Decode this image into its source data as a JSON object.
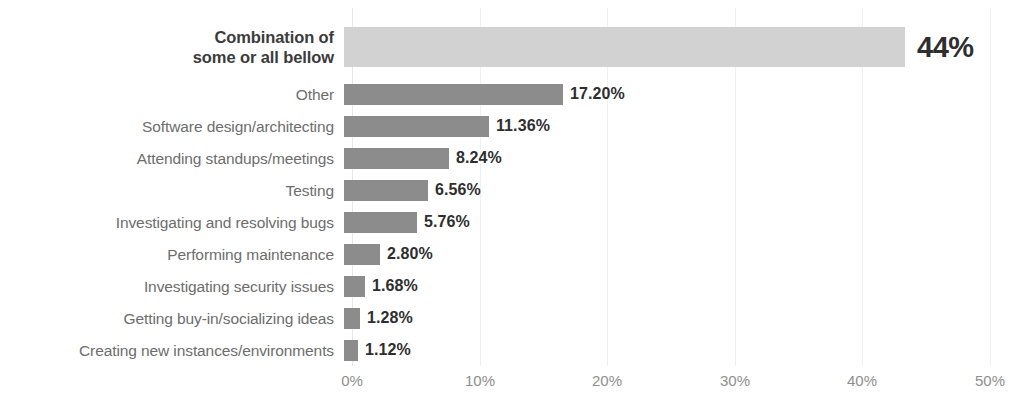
{
  "chart_data": {
    "type": "bar",
    "orientation": "horizontal",
    "title": "",
    "subtitle": "",
    "xlabel": "",
    "ylabel": "",
    "xlim": [
      0,
      50
    ],
    "grid": true,
    "legend": null,
    "tick_labels": [
      "0%",
      "10%",
      "20%",
      "30%",
      "40%",
      "50%"
    ],
    "tick_values": [
      0,
      10,
      20,
      30,
      40,
      50
    ],
    "categories": [
      "Combination of\nsome or all bellow",
      "Other",
      "Software design/architecting",
      "Attending standups/meetings",
      "Testing",
      "Investigating and resolving bugs",
      "Performing maintenance",
      "Investigating security issues",
      "Getting buy-in/socializing ideas",
      "Creating new instances/environments"
    ],
    "values": [
      44,
      17.2,
      11.36,
      8.24,
      6.56,
      5.76,
      2.8,
      1.68,
      1.28,
      1.12
    ],
    "value_labels": [
      "44%",
      "17.20%",
      "11.36%",
      "8.24%",
      "6.56%",
      "5.76%",
      "2.80%",
      "1.68%",
      "1.28%",
      "1.12%"
    ],
    "highlight_index": 0,
    "colors": {
      "bar": "#8c8c8c",
      "bar_highlight": "#d2d2d2",
      "value_label": "#2e2e2e",
      "category_label": "#6d6d6d",
      "category_label_highlight": "#3b3b3b",
      "tick_label": "#8e8e8e",
      "gridline": "#f0f0f0",
      "background": "#ffffff"
    }
  }
}
